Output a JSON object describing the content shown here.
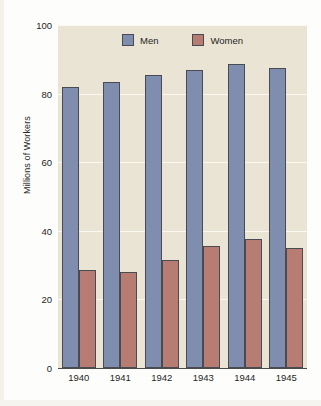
{
  "chart_data": {
    "type": "bar",
    "title": "",
    "xlabel": "",
    "ylabel": "Millions of Workers",
    "categories": [
      "1940",
      "1941",
      "1942",
      "1943",
      "1944",
      "1945"
    ],
    "series": [
      {
        "name": "Men",
        "color": "#7f8dae",
        "values": [
          82,
          83.5,
          85.5,
          87,
          88.5,
          87.5
        ]
      },
      {
        "name": "Women",
        "color": "#b87d72",
        "values": [
          28.5,
          28,
          31.5,
          35.5,
          37.5,
          35
        ]
      }
    ],
    "ylim": [
      0,
      100
    ],
    "yticks": [
      0,
      20,
      40,
      60,
      80,
      100
    ],
    "ytick_labels": [
      "0",
      "20",
      "40",
      "60",
      "80",
      "100"
    ],
    "grid": true,
    "legend_position": "top-center",
    "plot_background": "#e9e4d4",
    "gridline_color": "#fbf8ef"
  },
  "legend": {
    "entries": [
      {
        "label": "Men"
      },
      {
        "label": "Women"
      }
    ]
  }
}
